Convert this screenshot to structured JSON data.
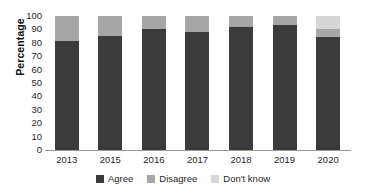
{
  "chart_data": {
    "type": "bar",
    "subtype": "stacked-column-100",
    "title": "",
    "xlabel": "",
    "ylabel": "Percentage",
    "ylim": [
      0,
      100
    ],
    "ytick_step": 10,
    "yticks": [
      100,
      90,
      80,
      70,
      60,
      50,
      40,
      30,
      20,
      10,
      0
    ],
    "grid": false,
    "legend_position": "bottom",
    "categories": [
      "2013",
      "2015",
      "2016",
      "2017",
      "2018",
      "2019",
      "2020"
    ],
    "series": [
      {
        "name": "Agree",
        "color": "#3b3b3b",
        "values": [
          81,
          85,
          90,
          88,
          92,
          93,
          84
        ]
      },
      {
        "name": "Disagree",
        "color": "#a6a6a6",
        "values": [
          19,
          15,
          10,
          12,
          8,
          7,
          6
        ]
      },
      {
        "name": "Don't know",
        "color": "#d6d6d6",
        "values": [
          0,
          0,
          0,
          0,
          0,
          0,
          10
        ]
      }
    ]
  },
  "colors": {
    "agree": "#3b3b3b",
    "disagree": "#a6a6a6",
    "dontknow": "#d6d6d6",
    "axis": "#9a9a9a",
    "text": "#1f1f1f",
    "background": "#ffffff"
  }
}
